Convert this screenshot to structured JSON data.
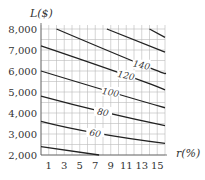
{
  "chart_data": {
    "type": "contour",
    "title": "",
    "xlabel": "r(%)",
    "ylabel": "L($)",
    "xlim": [
      0,
      16
    ],
    "ylim": [
      2000,
      8000
    ],
    "x_ticks": [
      1,
      3,
      5,
      7,
      9,
      11,
      13,
      15
    ],
    "y_ticks": [
      2000,
      3000,
      4000,
      5000,
      6000,
      7000,
      8000
    ],
    "y_tick_labels": [
      "2,000",
      "3,000",
      "4,000",
      "5,000",
      "6,000",
      "7,000",
      "8,000"
    ],
    "grid": true,
    "contours": [
      {
        "level": 40,
        "label": "",
        "points": [
          [
            0,
            2400
          ],
          [
            7.5,
            2000
          ]
        ]
      },
      {
        "level": 60,
        "label": "60",
        "points": [
          [
            0,
            3600
          ],
          [
            7,
            3050
          ],
          [
            16,
            2550
          ]
        ]
      },
      {
        "level": 80,
        "label": "80",
        "points": [
          [
            0,
            4800
          ],
          [
            8,
            4050
          ],
          [
            16,
            3400
          ]
        ]
      },
      {
        "level": 100,
        "label": "100",
        "points": [
          [
            0,
            6000
          ],
          [
            9,
            5000
          ],
          [
            16,
            4250
          ]
        ]
      },
      {
        "level": 120,
        "label": "120",
        "points": [
          [
            0,
            7200
          ],
          [
            11,
            5800
          ],
          [
            16,
            5100
          ]
        ]
      },
      {
        "level": 140,
        "label": "140",
        "points": [
          [
            2,
            8000
          ],
          [
            13,
            6300
          ],
          [
            16,
            5900
          ]
        ]
      },
      {
        "level": 160,
        "label": "",
        "points": [
          [
            8.5,
            8000
          ],
          [
            16,
            6900
          ]
        ]
      },
      {
        "level": 180,
        "label": "",
        "points": [
          [
            14,
            8000
          ],
          [
            16,
            7600
          ]
        ]
      }
    ]
  }
}
